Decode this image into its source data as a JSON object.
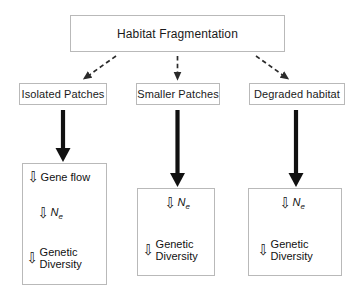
{
  "diagram": {
    "title_box": {
      "label": "Habitat Fragmentation"
    },
    "tier2": [
      {
        "label": "Isolated Patches"
      },
      {
        "label": "Smaller Patches"
      },
      {
        "label": "Degraded habitat"
      }
    ],
    "tier3": [
      {
        "id": "isolated-effects",
        "steps": [
          {
            "arrow": "down-hollow-arrow-icon",
            "glyph": "⇩",
            "label": "Gene flow",
            "style": "plain"
          },
          {
            "arrow": "down-hollow-arrow-icon",
            "glyph": "⇩",
            "label": "Ne",
            "style": "italic-sub",
            "base": "N",
            "sub": "e"
          },
          {
            "arrow": "down-hollow-arrow-icon",
            "glyph": "⇩",
            "label": "Genetic Diversity",
            "style": "two-line",
            "line1": "Genetic",
            "line2": "Diversity"
          }
        ]
      },
      {
        "id": "smaller-effects",
        "steps": [
          {
            "arrow": "down-hollow-arrow-icon",
            "glyph": "⇩",
            "label": "Ne",
            "style": "italic-sub",
            "base": "N",
            "sub": "e"
          },
          {
            "arrow": "down-hollow-arrow-icon",
            "glyph": "⇩",
            "label": "Genetic Diversity",
            "style": "two-line",
            "line1": "Genetic",
            "line2": "Diversity"
          }
        ]
      },
      {
        "id": "degraded-effects",
        "steps": [
          {
            "arrow": "down-hollow-arrow-icon",
            "glyph": "⇩",
            "label": "Ne",
            "style": "italic-sub",
            "base": "N",
            "sub": "e"
          },
          {
            "arrow": "down-hollow-arrow-icon",
            "glyph": "⇩",
            "label": "Genetic Diversity",
            "style": "two-line",
            "line1": "Genetic",
            "line2": "Diversity"
          }
        ]
      }
    ],
    "connectors": {
      "dashed_arrows": [
        {
          "name": "dashed-arrow-left",
          "direction": "down-left"
        },
        {
          "name": "dashed-arrow-center",
          "direction": "down"
        },
        {
          "name": "dashed-arrow-right",
          "direction": "down-right"
        }
      ],
      "thick_arrows": [
        {
          "name": "thick-arrow-left"
        },
        {
          "name": "thick-arrow-center"
        },
        {
          "name": "thick-arrow-right"
        }
      ]
    },
    "colors": {
      "box_border": "#b9b9b9",
      "text": "#1a1a1a",
      "arrow": "#111111",
      "background": "#ffffff"
    }
  }
}
